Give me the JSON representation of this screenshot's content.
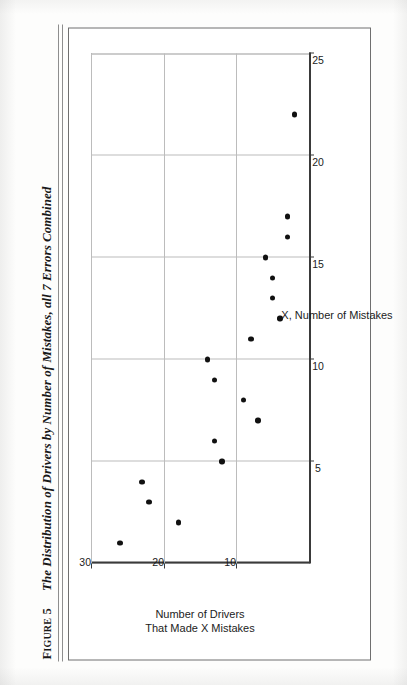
{
  "figure": {
    "label_prefix": "F",
    "label_rest": "IGURE",
    "label_number": "5",
    "title": "The Distribution of Drivers by Number of Mistakes, all 7 Errors Combined"
  },
  "chart_data": {
    "type": "scatter",
    "title": "The Distribution of Drivers by Number of Mistakes, all 7 Errors Combined",
    "xlabel": "X, Number of Mistakes",
    "ylabel": "Number of Drivers That Made X Mistakes",
    "ylabel_lines": [
      "Number of Drivers",
      "That Made X Mistakes"
    ],
    "xlim": [
      0,
      25
    ],
    "ylim": [
      0,
      30
    ],
    "xticks": [
      5,
      10,
      15,
      20,
      25
    ],
    "yticks": [
      10,
      20,
      30
    ],
    "xticklabels": [
      "5",
      "10",
      "15",
      "20",
      "25"
    ],
    "yticklabels": [
      "10",
      "20",
      "30"
    ],
    "grid": true,
    "legend": false,
    "marker_color": "#111111",
    "x": [
      1,
      2,
      3,
      4,
      5,
      6,
      7,
      8,
      9,
      10,
      11,
      12,
      13,
      14,
      15,
      16,
      17,
      22
    ],
    "y": [
      26,
      18,
      22,
      23,
      12,
      13,
      7,
      9,
      13,
      14,
      8,
      4,
      5,
      5,
      6,
      3,
      3,
      2
    ],
    "points": [
      {
        "x": 1,
        "y": 26
      },
      {
        "x": 2,
        "y": 18
      },
      {
        "x": 3,
        "y": 22
      },
      {
        "x": 4,
        "y": 23
      },
      {
        "x": 5,
        "y": 12
      },
      {
        "x": 6,
        "y": 13
      },
      {
        "x": 7,
        "y": 7
      },
      {
        "x": 8,
        "y": 9
      },
      {
        "x": 9,
        "y": 13
      },
      {
        "x": 10,
        "y": 14
      },
      {
        "x": 11,
        "y": 8
      },
      {
        "x": 12,
        "y": 4
      },
      {
        "x": 13,
        "y": 5
      },
      {
        "x": 14,
        "y": 5
      },
      {
        "x": 15,
        "y": 6
      },
      {
        "x": 16,
        "y": 3
      },
      {
        "x": 17,
        "y": 3
      },
      {
        "x": 22,
        "y": 2
      }
    ]
  }
}
